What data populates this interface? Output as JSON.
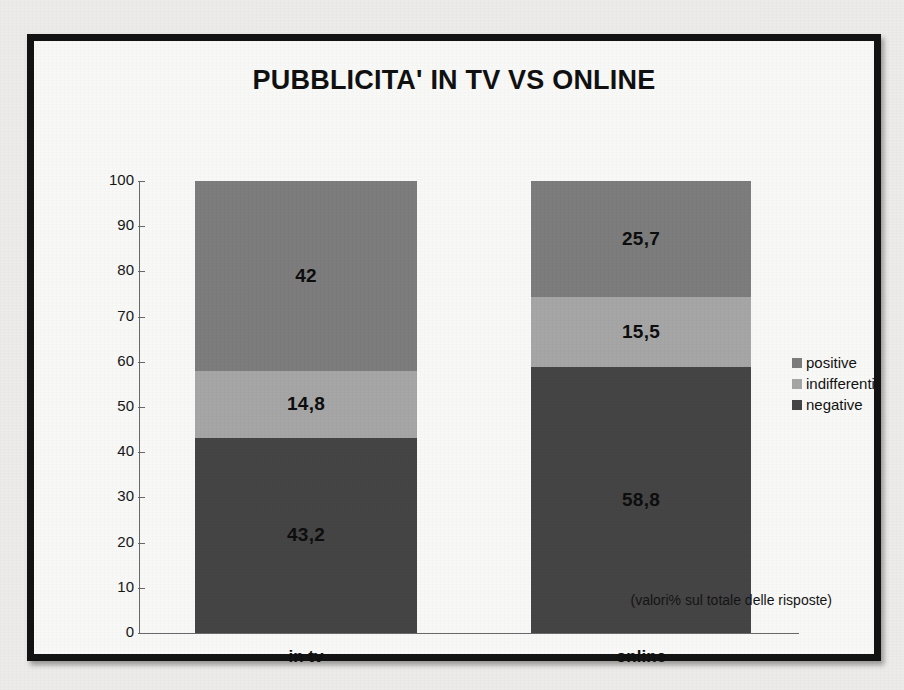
{
  "chart_data": {
    "type": "bar",
    "stacked": true,
    "title": "PUBBLICITA' IN TV VS ONLINE",
    "xlabel": "",
    "ylabel": "",
    "ylim": [
      0,
      100
    ],
    "yticks": [
      0,
      10,
      20,
      30,
      40,
      50,
      60,
      70,
      80,
      90,
      100
    ],
    "grid": false,
    "legend_position": "right",
    "categories": [
      "in tv",
      "online"
    ],
    "series": [
      {
        "name": "negative",
        "values": [
          43.2,
          58.8
        ],
        "labels": [
          "43,2",
          "58,8"
        ],
        "color": "#454545"
      },
      {
        "name": "indifferenti",
        "values": [
          14.8,
          15.5
        ],
        "labels": [
          "14,8",
          "15,5"
        ],
        "color": "#a8a8a8"
      },
      {
        "name": "positive",
        "values": [
          42.0,
          25.7
        ],
        "labels": [
          "42",
          "25,7"
        ],
        "color": "#7e7e7e"
      }
    ],
    "annotation": "(valori% sul totale delle risposte)"
  },
  "legend": {
    "items": [
      {
        "label": "positive",
        "color": "#7e7e7e"
      },
      {
        "label": "indifferenti",
        "color": "#a8a8a8"
      },
      {
        "label": "negative",
        "color": "#454545"
      }
    ]
  },
  "axis": {
    "ticks": [
      "100",
      "90",
      "80",
      "70",
      "60",
      "50",
      "40",
      "30",
      "20",
      "10",
      "0"
    ]
  },
  "colors": {
    "frame": "#131313",
    "page_background": "#efeeec",
    "plot_background": "#fbfbfa",
    "axis": "#6a6a6a",
    "text": "#101010"
  }
}
